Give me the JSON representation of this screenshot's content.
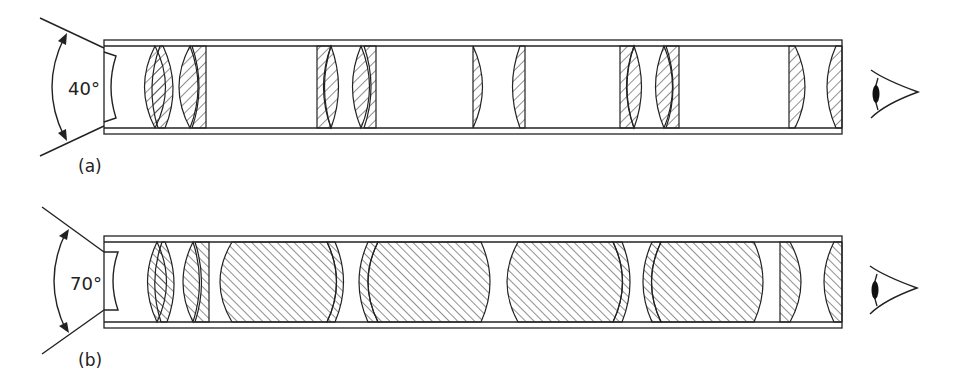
{
  "figure": {
    "panels": [
      {
        "id": "a",
        "label": "(a)",
        "angle_label": "40°",
        "field_of_view_deg": 40,
        "description": "Periscope tube with narrow field of view; thin lens groups",
        "lens_count": 10
      },
      {
        "id": "b",
        "label": "(b)",
        "angle_label": "70°",
        "field_of_view_deg": 70,
        "description": "Periscope tube with wide field of view; large thick lens groups",
        "lens_count": 12
      }
    ],
    "colors": {
      "stroke": "#222222",
      "hatch": "#333333",
      "background": "#ffffff"
    },
    "eye_icon": "eye-icon"
  }
}
